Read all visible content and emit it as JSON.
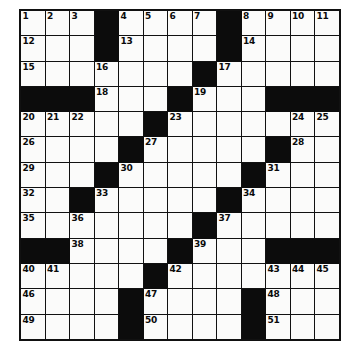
{
  "puzzle": {
    "kind": "crossword-grid",
    "rows": 13,
    "columns": 13,
    "colors": {
      "block": "#0c0c0c",
      "cell": "#fbfbfa",
      "border": "#111111",
      "number": "#0a0a0a",
      "background": "#ffffff"
    },
    "grid": [
      [
        {
          "type": "cell",
          "number": "1"
        },
        {
          "type": "cell",
          "number": "2"
        },
        {
          "type": "cell",
          "number": "3"
        },
        {
          "type": "block"
        },
        {
          "type": "cell",
          "number": "4"
        },
        {
          "type": "cell",
          "number": "5"
        },
        {
          "type": "cell",
          "number": "6"
        },
        {
          "type": "cell",
          "number": "7"
        },
        {
          "type": "block"
        },
        {
          "type": "cell",
          "number": "8"
        },
        {
          "type": "cell",
          "number": "9"
        },
        {
          "type": "cell",
          "number": "10"
        },
        {
          "type": "cell",
          "number": "11"
        }
      ],
      [
        {
          "type": "cell",
          "number": "12"
        },
        {
          "type": "cell",
          "number": ""
        },
        {
          "type": "cell",
          "number": ""
        },
        {
          "type": "block"
        },
        {
          "type": "cell",
          "number": "13"
        },
        {
          "type": "cell",
          "number": ""
        },
        {
          "type": "cell",
          "number": ""
        },
        {
          "type": "cell",
          "number": ""
        },
        {
          "type": "block"
        },
        {
          "type": "cell",
          "number": "14"
        },
        {
          "type": "cell",
          "number": ""
        },
        {
          "type": "cell",
          "number": ""
        },
        {
          "type": "cell",
          "number": ""
        }
      ],
      [
        {
          "type": "cell",
          "number": "15"
        },
        {
          "type": "cell",
          "number": ""
        },
        {
          "type": "cell",
          "number": ""
        },
        {
          "type": "cell",
          "number": "16"
        },
        {
          "type": "cell",
          "number": ""
        },
        {
          "type": "cell",
          "number": ""
        },
        {
          "type": "cell",
          "number": ""
        },
        {
          "type": "block"
        },
        {
          "type": "cell",
          "number": "17"
        },
        {
          "type": "cell",
          "number": ""
        },
        {
          "type": "cell",
          "number": ""
        },
        {
          "type": "cell",
          "number": ""
        },
        {
          "type": "cell",
          "number": ""
        }
      ],
      [
        {
          "type": "block"
        },
        {
          "type": "block"
        },
        {
          "type": "block"
        },
        {
          "type": "cell",
          "number": "18"
        },
        {
          "type": "cell",
          "number": ""
        },
        {
          "type": "cell",
          "number": ""
        },
        {
          "type": "block"
        },
        {
          "type": "cell",
          "number": "19"
        },
        {
          "type": "cell",
          "number": ""
        },
        {
          "type": "cell",
          "number": ""
        },
        {
          "type": "block"
        },
        {
          "type": "block"
        },
        {
          "type": "block"
        }
      ],
      [
        {
          "type": "cell",
          "number": "20"
        },
        {
          "type": "cell",
          "number": "21"
        },
        {
          "type": "cell",
          "number": "22"
        },
        {
          "type": "cell",
          "number": ""
        },
        {
          "type": "cell",
          "number": ""
        },
        {
          "type": "block"
        },
        {
          "type": "cell",
          "number": "23"
        },
        {
          "type": "cell",
          "number": ""
        },
        {
          "type": "cell",
          "number": ""
        },
        {
          "type": "cell",
          "number": ""
        },
        {
          "type": "cell",
          "number": ""
        },
        {
          "type": "cell",
          "number": "24"
        },
        {
          "type": "cell",
          "number": "25"
        }
      ],
      [
        {
          "type": "cell",
          "number": "26"
        },
        {
          "type": "cell",
          "number": ""
        },
        {
          "type": "cell",
          "number": ""
        },
        {
          "type": "cell",
          "number": ""
        },
        {
          "type": "block"
        },
        {
          "type": "cell",
          "number": "27"
        },
        {
          "type": "cell",
          "number": ""
        },
        {
          "type": "cell",
          "number": ""
        },
        {
          "type": "cell",
          "number": ""
        },
        {
          "type": "cell",
          "number": ""
        },
        {
          "type": "block"
        },
        {
          "type": "cell",
          "number": "28"
        },
        {
          "type": "cell",
          "number": ""
        }
      ],
      [
        {
          "type": "cell",
          "number": "29"
        },
        {
          "type": "cell",
          "number": ""
        },
        {
          "type": "cell",
          "number": ""
        },
        {
          "type": "block"
        },
        {
          "type": "cell",
          "number": "30"
        },
        {
          "type": "cell",
          "number": ""
        },
        {
          "type": "cell",
          "number": ""
        },
        {
          "type": "cell",
          "number": ""
        },
        {
          "type": "cell",
          "number": ""
        },
        {
          "type": "block"
        },
        {
          "type": "cell",
          "number": "31"
        },
        {
          "type": "cell",
          "number": ""
        },
        {
          "type": "cell",
          "number": ""
        }
      ],
      [
        {
          "type": "cell",
          "number": "32"
        },
        {
          "type": "cell",
          "number": ""
        },
        {
          "type": "block"
        },
        {
          "type": "cell",
          "number": "33"
        },
        {
          "type": "cell",
          "number": ""
        },
        {
          "type": "cell",
          "number": ""
        },
        {
          "type": "cell",
          "number": ""
        },
        {
          "type": "cell",
          "number": ""
        },
        {
          "type": "block"
        },
        {
          "type": "cell",
          "number": "34"
        },
        {
          "type": "cell",
          "number": ""
        },
        {
          "type": "cell",
          "number": ""
        },
        {
          "type": "cell",
          "number": ""
        }
      ],
      [
        {
          "type": "cell",
          "number": "35"
        },
        {
          "type": "cell",
          "number": ""
        },
        {
          "type": "cell",
          "number": "36"
        },
        {
          "type": "cell",
          "number": ""
        },
        {
          "type": "cell",
          "number": ""
        },
        {
          "type": "cell",
          "number": ""
        },
        {
          "type": "cell",
          "number": ""
        },
        {
          "type": "block"
        },
        {
          "type": "cell",
          "number": "37"
        },
        {
          "type": "cell",
          "number": ""
        },
        {
          "type": "cell",
          "number": ""
        },
        {
          "type": "cell",
          "number": ""
        },
        {
          "type": "cell",
          "number": ""
        }
      ],
      [
        {
          "type": "block"
        },
        {
          "type": "block"
        },
        {
          "type": "cell",
          "number": "38"
        },
        {
          "type": "cell",
          "number": ""
        },
        {
          "type": "cell",
          "number": ""
        },
        {
          "type": "cell",
          "number": ""
        },
        {
          "type": "block"
        },
        {
          "type": "cell",
          "number": "39"
        },
        {
          "type": "cell",
          "number": ""
        },
        {
          "type": "cell",
          "number": ""
        },
        {
          "type": "block"
        },
        {
          "type": "block"
        },
        {
          "type": "block"
        }
      ],
      [
        {
          "type": "cell",
          "number": "40"
        },
        {
          "type": "cell",
          "number": "41"
        },
        {
          "type": "cell",
          "number": ""
        },
        {
          "type": "cell",
          "number": ""
        },
        {
          "type": "cell",
          "number": ""
        },
        {
          "type": "block"
        },
        {
          "type": "cell",
          "number": "42"
        },
        {
          "type": "cell",
          "number": ""
        },
        {
          "type": "cell",
          "number": ""
        },
        {
          "type": "cell",
          "number": ""
        },
        {
          "type": "cell",
          "number": "43"
        },
        {
          "type": "cell",
          "number": "44"
        },
        {
          "type": "cell",
          "number": "45"
        }
      ],
      [
        {
          "type": "cell",
          "number": "46"
        },
        {
          "type": "cell",
          "number": ""
        },
        {
          "type": "cell",
          "number": ""
        },
        {
          "type": "cell",
          "number": ""
        },
        {
          "type": "block"
        },
        {
          "type": "cell",
          "number": "47"
        },
        {
          "type": "cell",
          "number": ""
        },
        {
          "type": "cell",
          "number": ""
        },
        {
          "type": "cell",
          "number": ""
        },
        {
          "type": "block"
        },
        {
          "type": "cell",
          "number": "48"
        },
        {
          "type": "cell",
          "number": ""
        },
        {
          "type": "cell",
          "number": ""
        }
      ],
      [
        {
          "type": "cell",
          "number": "49"
        },
        {
          "type": "cell",
          "number": ""
        },
        {
          "type": "cell",
          "number": ""
        },
        {
          "type": "cell",
          "number": ""
        },
        {
          "type": "block"
        },
        {
          "type": "cell",
          "number": "50"
        },
        {
          "type": "cell",
          "number": ""
        },
        {
          "type": "cell",
          "number": ""
        },
        {
          "type": "cell",
          "number": ""
        },
        {
          "type": "block"
        },
        {
          "type": "cell",
          "number": "51"
        },
        {
          "type": "cell",
          "number": ""
        },
        {
          "type": "cell",
          "number": ""
        }
      ]
    ]
  }
}
